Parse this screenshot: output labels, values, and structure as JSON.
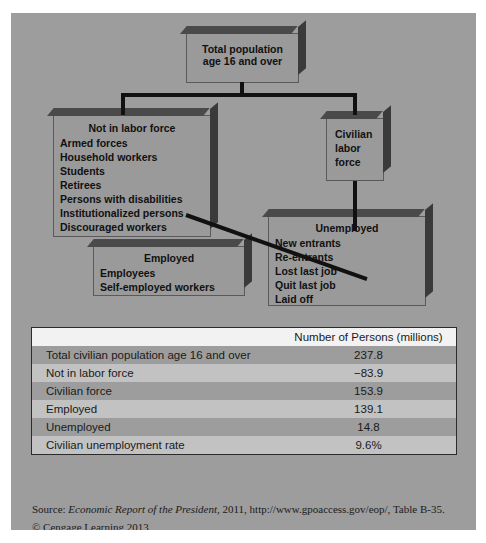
{
  "figure": {
    "background_color": "#9d9d9d",
    "box_fill_color": "#9a9a9a"
  },
  "diagram": {
    "total_population": {
      "title": "Total population",
      "subtitle": "age 16 and over"
    },
    "not_in_labor_force": {
      "title": "Not in labor force",
      "items": [
        "Armed forces",
        "Household workers",
        "Students",
        "Retirees",
        "Persons with disabilities",
        "Institutionalized persons",
        "Discouraged workers"
      ]
    },
    "civilian_labor_force": {
      "line1": "Civilian",
      "line2": "labor",
      "line3": "force"
    },
    "employed": {
      "title": "Employed",
      "items": [
        "Employees",
        "Self-employed workers"
      ]
    },
    "unemployed": {
      "title": "Unemployed",
      "items": [
        "New entrants",
        "Re-entrants",
        "Lost last job",
        "Quit last job",
        "Laid off"
      ]
    }
  },
  "table": {
    "headers": [
      "",
      "Number of Persons (millions)"
    ],
    "rows": [
      {
        "label": "Total civilian population age 16 and over",
        "value": "237.8",
        "indent": 0
      },
      {
        "label": "Not in labor force",
        "value": "−83.9",
        "indent": 0
      },
      {
        "label": "Civilian force",
        "value": "153.9",
        "indent": 0
      },
      {
        "label": "Employed",
        "value": "139.1",
        "indent": 1
      },
      {
        "label": "Unemployed",
        "value": "14.8",
        "indent": 1
      },
      {
        "label": "Civilian unemployment rate",
        "value": "9.6%",
        "indent": 0
      }
    ]
  },
  "footer": {
    "source_prefix": "Source: ",
    "source_title": "Economic Report of the President",
    "source_rest": ", 2011, http://www.gpoaccess.gov/eop/, Table B-35.",
    "copyright": "© Cengage Learning 2013"
  }
}
